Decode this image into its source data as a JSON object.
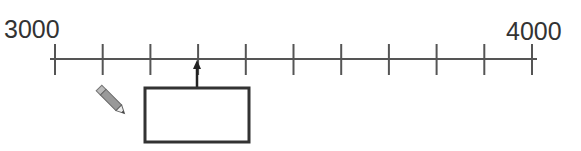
{
  "number_line": {
    "start_label": "3000",
    "end_label": "4000",
    "start_value": 3000,
    "end_value": 4000,
    "tick_count": 11,
    "step": 100,
    "arrow_tick_index": 3,
    "answer_box": {
      "value": ""
    },
    "line_color": "#555555",
    "box_color": "#333333"
  },
  "icons": {
    "pencil": "pencil-icon"
  }
}
